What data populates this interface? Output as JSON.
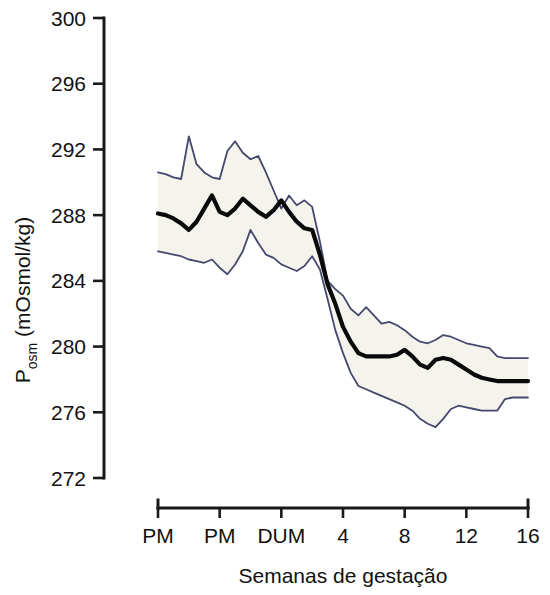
{
  "chart_data": {
    "type": "line",
    "title": "",
    "xlabel": "Semanas de gestação",
    "ylabel": "P",
    "ylabel_sub": "osm",
    "ylabel_unit": " (mOsmol/kg)",
    "ylabel_full": "Posm (mOsmol/kg)",
    "grid": false,
    "legend": "none",
    "ylim": [
      272,
      300
    ],
    "yticks": [
      300,
      296,
      292,
      288,
      284,
      280,
      276,
      272
    ],
    "ytick_labels": [
      "300",
      "296",
      "292",
      "288",
      "284",
      "280",
      "276",
      "272"
    ],
    "xtick_labels": [
      "PM",
      "PM",
      "DUM",
      "4",
      "8",
      "12",
      "16"
    ],
    "xtick_values": [
      -8,
      -4,
      0,
      4,
      8,
      12,
      16
    ],
    "xlim": [
      -8,
      16
    ],
    "x": [
      -8.0,
      -7.5,
      -7.0,
      -6.5,
      -6.0,
      -5.5,
      -5.0,
      -4.5,
      -4.0,
      -3.5,
      -3.0,
      -2.5,
      -2.0,
      -1.5,
      -1.0,
      -0.5,
      0.0,
      0.5,
      1.0,
      1.5,
      2.0,
      2.5,
      3.0,
      3.5,
      4.0,
      4.5,
      5.0,
      5.5,
      6.0,
      6.5,
      7.0,
      7.5,
      8.0,
      8.5,
      9.0,
      9.5,
      10.0,
      10.5,
      11.0,
      11.5,
      12.0,
      12.5,
      13.0,
      13.5,
      14.0,
      14.5,
      15.0,
      15.5,
      16.0
    ],
    "series": [
      {
        "name": "upper bound (mean + SD)",
        "color": "#44486e",
        "values": [
          290.6,
          290.5,
          290.3,
          290.2,
          292.8,
          291.1,
          290.6,
          290.3,
          290.2,
          291.9,
          292.5,
          291.8,
          291.4,
          291.6,
          290.6,
          289.5,
          288.4,
          289.2,
          288.6,
          288.9,
          288.5,
          286.4,
          284.0,
          283.5,
          283.1,
          282.3,
          281.9,
          282.4,
          281.9,
          281.4,
          281.5,
          281.3,
          281.0,
          280.6,
          280.3,
          280.2,
          280.4,
          280.7,
          280.6,
          280.4,
          280.2,
          280.1,
          280.0,
          279.9,
          279.4,
          279.3,
          279.3,
          279.3,
          279.3
        ]
      },
      {
        "name": "mean",
        "color": "#0a0a0a",
        "values": [
          288.1,
          288.0,
          287.8,
          287.5,
          287.1,
          287.6,
          288.4,
          289.2,
          288.2,
          288.0,
          288.4,
          289.0,
          288.6,
          288.2,
          287.9,
          288.3,
          288.9,
          288.2,
          287.6,
          287.2,
          287.1,
          285.6,
          283.8,
          282.6,
          281.2,
          280.3,
          279.6,
          279.4,
          279.4,
          279.4,
          279.4,
          279.5,
          279.8,
          279.4,
          278.9,
          278.7,
          279.2,
          279.3,
          279.2,
          278.9,
          278.6,
          278.3,
          278.1,
          278.0,
          277.9,
          277.9,
          277.9,
          277.9,
          277.9
        ]
      },
      {
        "name": "lower bound (mean - SD)",
        "color": "#44486e",
        "values": [
          285.8,
          285.7,
          285.6,
          285.5,
          285.3,
          285.2,
          285.1,
          285.3,
          284.8,
          284.4,
          285.0,
          285.8,
          287.1,
          286.3,
          285.6,
          285.4,
          285.0,
          284.8,
          284.6,
          284.9,
          285.5,
          284.7,
          282.9,
          281.0,
          279.6,
          278.4,
          277.6,
          277.4,
          277.2,
          277.0,
          276.8,
          276.6,
          276.4,
          276.1,
          275.6,
          275.3,
          275.1,
          275.6,
          276.2,
          276.4,
          276.3,
          276.2,
          276.1,
          276.1,
          276.1,
          276.8,
          276.9,
          276.9,
          276.9
        ]
      }
    ]
  }
}
